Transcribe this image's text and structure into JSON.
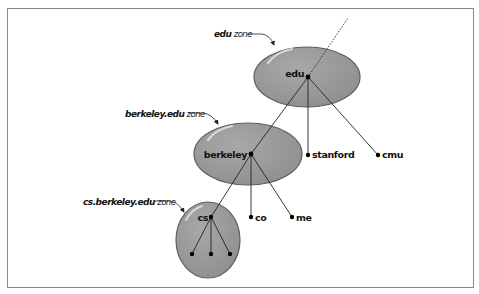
{
  "diagram": {
    "colors": {
      "frame": "#8a8a8a",
      "zone_fill": "#9b9b9b",
      "zone_stroke": "#5a5a5a",
      "line": "#222222",
      "node": "#000000"
    },
    "zones": [
      {
        "id": "edu",
        "name_bold": "edu",
        "name_suffix": " zone"
      },
      {
        "id": "berkeley",
        "name_bold": "berkeley.edu",
        "name_suffix": " zone"
      },
      {
        "id": "cs",
        "name_bold": "cs.berkeley.edu",
        "name_suffix": " zone"
      }
    ],
    "nodes": {
      "edu": "edu",
      "berkeley": "berkeley",
      "stanford": "stanford",
      "cmu": "cmu",
      "cs": "cs",
      "co": "co",
      "me": "me"
    },
    "edges": [
      [
        "edu",
        "berkeley"
      ],
      [
        "edu",
        "stanford"
      ],
      [
        "edu",
        "cmu"
      ],
      [
        "berkeley",
        "cs"
      ],
      [
        "berkeley",
        "co"
      ],
      [
        "berkeley",
        "me"
      ],
      [
        "cs",
        "cs-child-1"
      ],
      [
        "cs",
        "cs-child-2"
      ],
      [
        "cs",
        "cs-child-3"
      ]
    ]
  }
}
